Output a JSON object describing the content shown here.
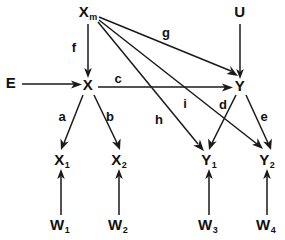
{
  "diagram": {
    "type": "path-diagram",
    "background_color": "#ffffff",
    "ink_color": "#1a1a1a",
    "nodes": [
      {
        "id": "Xm",
        "base": "X",
        "sub": "m",
        "x": 88,
        "y": 13
      },
      {
        "id": "U",
        "base": "U",
        "sub": "",
        "x": 240,
        "y": 13
      },
      {
        "id": "E",
        "base": "E",
        "sub": "",
        "x": 11,
        "y": 84
      },
      {
        "id": "X",
        "base": "X",
        "sub": "",
        "x": 88,
        "y": 86
      },
      {
        "id": "Y",
        "base": "Y",
        "sub": "",
        "x": 240,
        "y": 87
      },
      {
        "id": "X1",
        "base": "X",
        "sub": "1",
        "x": 62,
        "y": 161
      },
      {
        "id": "X2",
        "base": "X",
        "sub": "2",
        "x": 119,
        "y": 161
      },
      {
        "id": "Y1",
        "base": "Y",
        "sub": "1",
        "x": 209,
        "y": 161
      },
      {
        "id": "Y2",
        "base": "Y",
        "sub": "2",
        "x": 267,
        "y": 161
      },
      {
        "id": "W1",
        "base": "W",
        "sub": "1",
        "x": 60,
        "y": 226
      },
      {
        "id": "W2",
        "base": "W",
        "sub": "2",
        "x": 118,
        "y": 226
      },
      {
        "id": "W3",
        "base": "W",
        "sub": "3",
        "x": 208,
        "y": 226
      },
      {
        "id": "W4",
        "base": "W",
        "sub": "4",
        "x": 266,
        "y": 226
      }
    ],
    "edge_labels": [
      {
        "id": "f",
        "text": "f",
        "x": 74,
        "y": 47
      },
      {
        "id": "g",
        "text": "g",
        "x": 166,
        "y": 32
      },
      {
        "id": "c",
        "text": "c",
        "x": 118,
        "y": 78
      },
      {
        "id": "i",
        "text": "i",
        "x": 185,
        "y": 103
      },
      {
        "id": "d",
        "text": "d",
        "x": 223,
        "y": 104
      },
      {
        "id": "a",
        "text": "a",
        "x": 62,
        "y": 116
      },
      {
        "id": "b",
        "text": "b",
        "x": 110,
        "y": 116
      },
      {
        "id": "h",
        "text": "h",
        "x": 159,
        "y": 119
      },
      {
        "id": "e",
        "text": "e",
        "x": 264,
        "y": 116
      }
    ],
    "edges": [
      {
        "id": "Xm-X",
        "from": "Xm",
        "to": "X",
        "label": "f"
      },
      {
        "id": "Xm-Y",
        "from": "Xm",
        "to": "Y",
        "label": "g"
      },
      {
        "id": "Xm-Y1",
        "from": "Xm",
        "to": "Y1",
        "label": "h"
      },
      {
        "id": "Xm-Y2",
        "from": "Xm",
        "to": "Y2",
        "label": "i"
      },
      {
        "id": "U-Y",
        "from": "U",
        "to": "Y",
        "label": ""
      },
      {
        "id": "E-X",
        "from": "E",
        "to": "X",
        "label": ""
      },
      {
        "id": "X-Y",
        "from": "X",
        "to": "Y",
        "label": "c"
      },
      {
        "id": "X-X1",
        "from": "X",
        "to": "X1",
        "label": "a"
      },
      {
        "id": "X-X2",
        "from": "X",
        "to": "X2",
        "label": "b"
      },
      {
        "id": "Y-Y1",
        "from": "Y",
        "to": "Y1",
        "label": "d"
      },
      {
        "id": "Y-Y2",
        "from": "Y",
        "to": "Y2",
        "label": "e"
      },
      {
        "id": "W1-X1",
        "from": "W1",
        "to": "X1",
        "label": ""
      },
      {
        "id": "W2-X2",
        "from": "W2",
        "to": "X2",
        "label": ""
      },
      {
        "id": "W3-Y1",
        "from": "W3",
        "to": "Y1",
        "label": ""
      },
      {
        "id": "W4-Y2",
        "from": "W4",
        "to": "Y2",
        "label": ""
      }
    ]
  }
}
